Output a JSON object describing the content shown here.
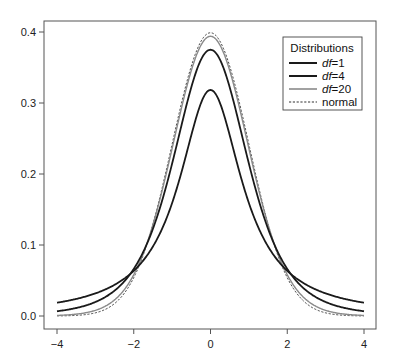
{
  "chart_data": {
    "type": "line",
    "title": "",
    "xlabel": "",
    "ylabel": "",
    "xlim": [
      -4.35,
      4.35
    ],
    "ylim": [
      -0.018,
      0.415
    ],
    "x_ticks": [
      -4,
      -2,
      0,
      2,
      4
    ],
    "x_tick_labels": [
      "−4",
      "−2",
      "0",
      "2",
      "4"
    ],
    "y_ticks": [
      0.0,
      0.1,
      0.2,
      0.3,
      0.4
    ],
    "y_tick_labels": [
      "0.0",
      "0.1",
      "0.2",
      "0.3",
      "0.4"
    ],
    "grid": false,
    "legend": {
      "title": "Distributions",
      "position": "top-right",
      "entries": [
        {
          "label_prefix": "df",
          "label_suffix": "=1",
          "series": "t_df1"
        },
        {
          "label_prefix": "df",
          "label_suffix": "=4",
          "series": "t_df4"
        },
        {
          "label_prefix": "df",
          "label_suffix": "=20",
          "series": "t_df20"
        },
        {
          "label_prefix": "",
          "label_suffix": "normal",
          "series": "normal"
        }
      ]
    },
    "x": [
      -4,
      -3,
      -2,
      -1,
      0,
      1,
      2,
      3,
      4
    ],
    "series": [
      {
        "name": "df=1",
        "key": "t_df1",
        "df": 1,
        "color": "#1a1a1a",
        "width": 1.8,
        "dash": "",
        "values": [
          0.0187,
          0.0318,
          0.0637,
          0.1592,
          0.3183,
          0.1592,
          0.0637,
          0.0318,
          0.0187
        ]
      },
      {
        "name": "df=4",
        "key": "t_df4",
        "df": 4,
        "color": "#1a1a1a",
        "width": 1.8,
        "dash": "",
        "values": [
          0.0066,
          0.0197,
          0.0663,
          0.2147,
          0.375,
          0.2147,
          0.0663,
          0.0197,
          0.0066
        ]
      },
      {
        "name": "df=20",
        "key": "t_df20",
        "df": 20,
        "color": "#8a8a8a",
        "width": 1.4,
        "dash": "",
        "values": [
          0.0008,
          0.0077,
          0.0581,
          0.236,
          0.394,
          0.236,
          0.0581,
          0.0077,
          0.0008
        ]
      },
      {
        "name": "normal",
        "key": "normal",
        "df": null,
        "color": "#333333",
        "width": 0.9,
        "dash": "2.2,1.6",
        "values": [
          0.0001,
          0.0044,
          0.054,
          0.242,
          0.3989,
          0.242,
          0.054,
          0.0044,
          0.0001
        ]
      }
    ]
  }
}
